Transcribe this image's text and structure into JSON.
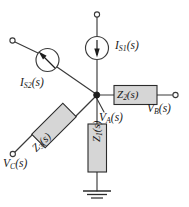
{
  "figure": {
    "background_color": "#ffffff",
    "line_color": "#3a3a3a",
    "box_fill_color": "#d6d6d6",
    "box_border_color": "#2b2b2b",
    "text_color": "#1a1a1a"
  },
  "sources": [
    {
      "id": "is1",
      "label": "I",
      "subscript": "S1",
      "suffix": "(s)",
      "full_label": "I_S1(s)",
      "kind": "current-source",
      "arrow_direction": "down",
      "orientation": "vertical"
    },
    {
      "id": "is2",
      "label": "I",
      "subscript": "S2",
      "suffix": "(s)",
      "full_label": "I_S2(s)",
      "kind": "current-source",
      "arrow_direction": "up-left",
      "orientation": "diagonal"
    }
  ],
  "impedances": [
    {
      "id": "z1",
      "label": "Z",
      "subscript": "1",
      "suffix": "(s)",
      "full_label": "Z_1(s)",
      "orientation": "vertical"
    },
    {
      "id": "z2",
      "label": "Z",
      "subscript": "2",
      "suffix": "(s)",
      "full_label": "Z_2(s)",
      "orientation": "horizontal"
    },
    {
      "id": "z3",
      "label": "Z",
      "subscript": "3",
      "suffix": "(s)",
      "full_label": "Z_3(s)",
      "orientation": "diagonal-45"
    }
  ],
  "nodes": [
    {
      "id": "va",
      "label": "V",
      "subscript": "A",
      "suffix": "(s)",
      "full_label": "V_A(s)",
      "kind": "node-voltage",
      "marker": "filled-dot"
    },
    {
      "id": "vb",
      "label": "V",
      "subscript": "B",
      "suffix": "(s)",
      "full_label": "V_B(s)",
      "kind": "terminal-voltage",
      "marker": "open-circle"
    },
    {
      "id": "vc",
      "label": "V",
      "subscript": "C",
      "suffix": "(s)",
      "full_label": "V_C(s)",
      "kind": "terminal-voltage",
      "marker": "open-circle"
    }
  ],
  "terminals": [
    {
      "id": "top-terminal",
      "marker": "open-circle",
      "label": ""
    },
    {
      "id": "upper-left-terminal",
      "marker": "open-circle",
      "label": ""
    },
    {
      "id": "right-terminal",
      "marker": "open-circle",
      "label": "V_B(s)"
    },
    {
      "id": "lower-left-terminal",
      "marker": "open-circle",
      "label": "V_C(s)"
    }
  ],
  "ground": {
    "id": "ground",
    "symbol": "earth-ground",
    "bar_count": 3
  }
}
